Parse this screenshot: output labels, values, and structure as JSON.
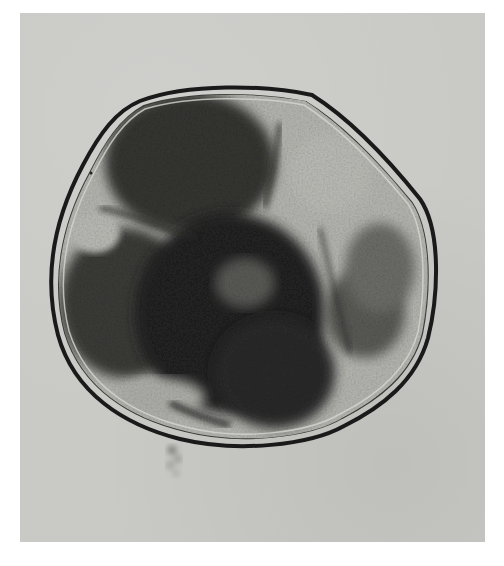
{
  "image": {
    "subject": "micrograph of a multicellular embryo within a membrane",
    "style": "grayscale brightfield microscopy",
    "colors": {
      "page_background": "#ffffff",
      "field_background": "#c9c9c6",
      "membrane": "#1e1e1e",
      "cell_light": "#b8b8b3",
      "cell_dark": "#2a2a28"
    }
  }
}
